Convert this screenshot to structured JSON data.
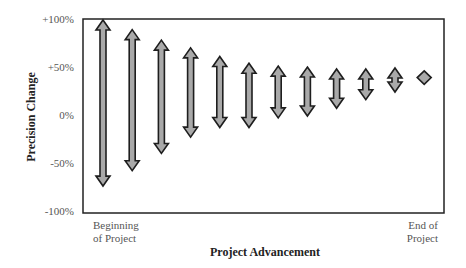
{
  "chart_data": {
    "type": "range-arrows",
    "title": "",
    "xlabel": "Project Advancement",
    "ylabel": "Precision Change",
    "x_endpoints": {
      "start": "Beginning of Project",
      "end": "End of Project"
    },
    "x_endpoint_lines": {
      "start": [
        "Beginning",
        "of Project"
      ],
      "end": [
        "End of",
        "Project"
      ]
    },
    "y_ticks": [
      "+100%",
      "+50%",
      "0%",
      "-50%",
      "-100%"
    ],
    "y_tick_values": [
      100,
      50,
      0,
      -50,
      -100
    ],
    "ylim": [
      -100,
      100
    ],
    "grid": false,
    "legend": null,
    "series": [
      {
        "name": "Precision range",
        "points": [
          {
            "index": 1,
            "high": 100,
            "low": -73
          },
          {
            "index": 2,
            "high": 90,
            "low": -57
          },
          {
            "index": 3,
            "high": 79,
            "low": -39
          },
          {
            "index": 4,
            "high": 71,
            "low": -22
          },
          {
            "index": 5,
            "high": 62,
            "low": -12
          },
          {
            "index": 6,
            "high": 55,
            "low": -12
          },
          {
            "index": 7,
            "high": 52,
            "low": -2
          },
          {
            "index": 8,
            "high": 51,
            "low": 0
          },
          {
            "index": 9,
            "high": 49,
            "low": 8
          },
          {
            "index": 10,
            "high": 49,
            "low": 17
          },
          {
            "index": 11,
            "high": 50,
            "low": 25
          },
          {
            "index": 12,
            "high": 47,
            "low": 33
          }
        ]
      }
    ],
    "colors": {
      "arrow_fill": "#a9a9a9",
      "arrow_outline": "#1e1e1e",
      "frame": "#222222"
    }
  }
}
